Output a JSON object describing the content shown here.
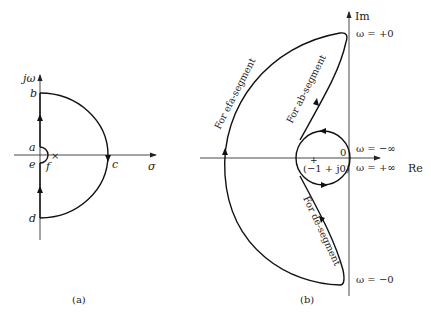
{
  "figure": {
    "panel_a": {
      "caption": "(a)",
      "vertical_axis_label": "jω",
      "horizontal_axis_label": "σ",
      "points": {
        "a": "a",
        "b": "b",
        "c": "c",
        "d": "d",
        "e": "e",
        "f": "f"
      },
      "pole_marker": "×"
    },
    "panel_b": {
      "caption": "(b)",
      "vertical_axis_label": "Im",
      "horizontal_axis_label": "Re",
      "origin_label": "0",
      "critical_point_label": "(−1 + j0)",
      "critical_point_marker": "+",
      "frequency_labels": {
        "top": "ω = +0",
        "neg_inf": "ω = −∞",
        "pos_inf": "ω = +∞",
        "bottom": "ω = −0"
      },
      "segment_labels": {
        "efa": "For efa-segment",
        "ab": "For ab-segment",
        "de": "For de-segment"
      }
    }
  }
}
